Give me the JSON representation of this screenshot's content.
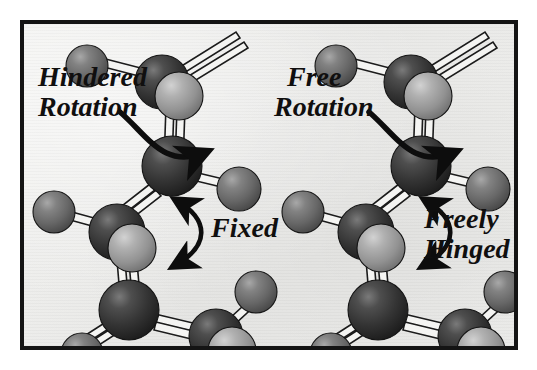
{
  "figure": {
    "background_color": "#ebebe9",
    "border_color": "#141414",
    "page_color": "#ffffff"
  },
  "colors": {
    "atom_dark": "#3a3a3a",
    "atom_dark_shadow": "#1e1e1e",
    "atom_dark_highlight": "#6a6a6a",
    "atom_medium": "#6f6f6f",
    "atom_medium_shadow": "#4a4a4a",
    "atom_medium_highlight": "#9d9d9d",
    "atom_light": "#9a9a9a",
    "atom_light_highlight": "#c6c6c6",
    "bond_fill": "#f4f4f2",
    "bond_outline": "#1b1b1b",
    "arrow_color": "#0d0d0d",
    "text_color": "#100f0f"
  },
  "panels": [
    {
      "id": "left-panel",
      "name": "hindered-rotation-panel",
      "labels": [
        {
          "id": "hindered-rotation",
          "line1": "Hindered",
          "line2": "Rotation",
          "x": 14,
          "y": 62
        },
        {
          "id": "fixed",
          "line1": "Fixed",
          "line2": "",
          "x": 152,
          "y": 205
        }
      ],
      "arrows": [
        {
          "id": "rotation-arrow",
          "type": "single-headed-curve",
          "direction": "clockwise-up-right"
        },
        {
          "id": "fixed-arrow",
          "type": "double-headed-curve",
          "direction": "bidirectional-vertical"
        }
      ],
      "atoms": [
        {
          "id": "L-a1",
          "type": "medium",
          "cx": 63,
          "cy": 42,
          "r": 21
        },
        {
          "id": "L-a2",
          "type": "dark",
          "cx": 138,
          "cy": 58,
          "r": 27
        },
        {
          "id": "L-a3",
          "type": "light",
          "cx": 155,
          "cy": 72,
          "r": 24
        },
        {
          "id": "L-a4",
          "type": "dark",
          "cx": 148,
          "cy": 142,
          "r": 30
        },
        {
          "id": "L-a5",
          "type": "medium",
          "cx": 215,
          "cy": 165,
          "r": 22
        },
        {
          "id": "L-a6",
          "type": "medium",
          "cx": 30,
          "cy": 188,
          "r": 21
        },
        {
          "id": "L-a7",
          "type": "dark",
          "cx": 93,
          "cy": 208,
          "r": 28
        },
        {
          "id": "L-a8",
          "type": "light",
          "cx": 108,
          "cy": 224,
          "r": 24
        },
        {
          "id": "L-a9",
          "type": "dark",
          "cx": 105,
          "cy": 286,
          "r": 30
        },
        {
          "id": "L-a10",
          "type": "medium",
          "cx": 58,
          "cy": 330,
          "r": 21
        },
        {
          "id": "L-a11",
          "type": "dark",
          "cx": 192,
          "cy": 312,
          "r": 27
        },
        {
          "id": "L-a12",
          "type": "light",
          "cx": 208,
          "cy": 327,
          "r": 24
        },
        {
          "id": "L-a13",
          "type": "medium",
          "cx": 232,
          "cy": 268,
          "r": 21
        }
      ]
    },
    {
      "id": "right-panel",
      "name": "free-rotation-panel",
      "labels": [
        {
          "id": "free-rotation",
          "line1": "Free",
          "line2": "Rotation",
          "x": 262,
          "y": 62
        },
        {
          "id": "freely-hinged",
          "line1": "Freely",
          "line2": "Hinged",
          "x": 400,
          "y": 196
        }
      ],
      "arrows": [
        {
          "id": "rotation-arrow",
          "type": "single-headed-curve",
          "direction": "clockwise-up-right"
        },
        {
          "id": "hinge-arrow",
          "type": "double-headed-curve",
          "direction": "bidirectional-vertical"
        }
      ],
      "atoms": [
        {
          "id": "R-a1",
          "type": "medium",
          "cx": 312,
          "cy": 42,
          "r": 21
        },
        {
          "id": "R-a2",
          "type": "dark",
          "cx": 387,
          "cy": 58,
          "r": 27
        },
        {
          "id": "R-a3",
          "type": "light",
          "cx": 404,
          "cy": 72,
          "r": 24
        },
        {
          "id": "R-a4",
          "type": "dark",
          "cx": 397,
          "cy": 142,
          "r": 30
        },
        {
          "id": "R-a5",
          "type": "medium",
          "cx": 464,
          "cy": 165,
          "r": 22
        },
        {
          "id": "R-a6",
          "type": "medium",
          "cx": 279,
          "cy": 188,
          "r": 21
        },
        {
          "id": "R-a7",
          "type": "dark",
          "cx": 342,
          "cy": 208,
          "r": 28
        },
        {
          "id": "R-a8",
          "type": "light",
          "cx": 357,
          "cy": 224,
          "r": 24
        },
        {
          "id": "R-a9",
          "type": "dark",
          "cx": 354,
          "cy": 286,
          "r": 30
        },
        {
          "id": "R-a10",
          "type": "medium",
          "cx": 307,
          "cy": 330,
          "r": 21
        },
        {
          "id": "R-a11",
          "type": "dark",
          "cx": 441,
          "cy": 312,
          "r": 27
        },
        {
          "id": "R-a12",
          "type": "light",
          "cx": 457,
          "cy": 327,
          "r": 24
        },
        {
          "id": "R-a13",
          "type": "medium",
          "cx": 481,
          "cy": 268,
          "r": 21
        }
      ]
    }
  ]
}
